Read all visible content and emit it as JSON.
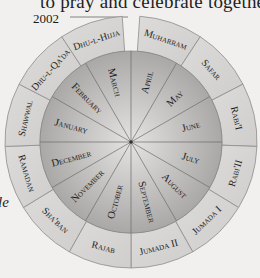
{
  "header": {
    "partial_text": "to pray and celebrate together."
  },
  "year_label": "2002",
  "side_fragment": "le",
  "wheel": {
    "center": [
      131,
      142
    ],
    "inner_radius": 91,
    "outer_radius": 126,
    "colors": {
      "outer_ring_fill": "#d6d5d3",
      "outer_ring_stroke": "#8f8d8a",
      "inner_disk_light": "#e0dfdd",
      "inner_disk_dark": "#a8a7a5",
      "divider": "#6e6c69",
      "text": "#1c1c1c"
    },
    "gregorian_months": [
      {
        "label": "March"
      },
      {
        "label": "April"
      },
      {
        "label": "May"
      },
      {
        "label": "June"
      },
      {
        "label": "July"
      },
      {
        "label": "August"
      },
      {
        "label": "September"
      },
      {
        "label": "October"
      },
      {
        "label": "November"
      },
      {
        "label": "December"
      },
      {
        "label": "January"
      },
      {
        "label": "February"
      }
    ],
    "islamic_months": [
      {
        "label": "Muharram"
      },
      {
        "label": "Safar"
      },
      {
        "label": "Rabi'I"
      },
      {
        "label": "Rabi'II"
      },
      {
        "label": "Jumada I"
      },
      {
        "label": "Jumada II"
      },
      {
        "label": "Rajab"
      },
      {
        "label": "Sha'ban"
      },
      {
        "label": "Ramadan"
      },
      {
        "label": "Shawwal"
      },
      {
        "label": "Dhu-l-Qa'da"
      },
      {
        "label": "Dhu-l-Hijja"
      }
    ]
  }
}
